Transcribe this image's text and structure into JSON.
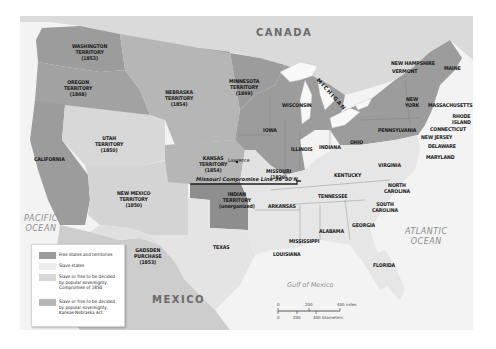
{
  "map": {
    "title": "Kansas-Nebraska Act and Missouri Compromise Map",
    "colors": {
      "free": "#9c9c9c",
      "slave": "#e2e2e2",
      "popular_1850": "#d2d2d2",
      "popular_kn": "#b4b4b4",
      "foreign": "#cfcfcf",
      "water": "#f4f4f4"
    },
    "countries": {
      "canada": "CANADA",
      "mexico": "MEXICO"
    },
    "water_bodies": {
      "pacific": "PACIFIC\nOCEAN",
      "atlantic": "ATLANTIC\nOCEAN",
      "gulf": "Gulf of Mexico",
      "michigan_lake": "MICHIGAN"
    },
    "missouri_compromise_line": "Missouri Compromise Line 36°30'N",
    "city": "Lawrence",
    "regions": {
      "washington": "WASHINGTON\nTERRITORY\n(1853)",
      "oregon": "OREGON\nTERRITORY\n(1848)",
      "california": "CALIFORNIA",
      "utah": "UTAH\nTERRITORY\n(1850)",
      "new_mexico": "NEW MEXICO\nTERRITORY\n(1850)",
      "gadsden": "GADSDEN\nPURCHASE\n(1853)",
      "nebraska": "NEBRASKA\nTERRITORY\n(1854)",
      "minnesota": "MINNESOTA\nTERRITORY\n(1849)",
      "kansas": "KANSAS\nTERRITORY\n(1854)",
      "indian": "INDIAN\nTERRITORY\n(unorganized)",
      "texas": "TEXAS",
      "wisconsin": "WISCONSIN",
      "iowa": "IOWA",
      "missouri": "MISSOURI\n(1820)",
      "arkansas": "ARKANSAS",
      "louisiana": "LOUISIANA",
      "mississippi": "MISSISSIPPI",
      "alabama": "ALABAMA",
      "illinois": "ILLINOIS",
      "indiana": "INDIANA",
      "ohio": "OHIO",
      "kentucky": "KENTUCKY",
      "tennessee": "TENNESSEE",
      "georgia": "GEORGIA",
      "florida": "FLORIDA",
      "south_carolina": "SOUTH\nCAROLINA",
      "north_carolina": "NORTH\nCAROLINA",
      "virginia": "VIRGINIA",
      "pennsylvania": "PENNSYLVANIA",
      "new_york": "NEW\nYORK",
      "vermont": "VERMONT",
      "new_hampshire": "NEW HAMPSHIRE",
      "maine": "MAINE",
      "massachusetts": "MASSACHUSETTS",
      "rhode_island": "RHODE\nISLAND",
      "connecticut": "CONNECTICUT",
      "new_jersey": "NEW JERSEY",
      "delaware": "DELAWARE",
      "maryland": "MARYLAND"
    }
  },
  "legend": {
    "items": [
      {
        "label": "Free states and territories",
        "color": "#9c9c9c"
      },
      {
        "label": "Slave states",
        "color": "#ececec"
      },
      {
        "label": "Slave or free to be decided\nby popular sovereignty,\nCompromise of 1850",
        "color": "#d6d6d6"
      },
      {
        "label": "Slave or free to be decided\nby popular sovereignty,\nKansas-Nebraska Act",
        "color": "#b8b8b8"
      }
    ]
  },
  "scale_bar": {
    "miles": [
      "0",
      "200",
      "400 miles"
    ],
    "kilometers": [
      "0",
      "200",
      "400 kilometers"
    ]
  }
}
